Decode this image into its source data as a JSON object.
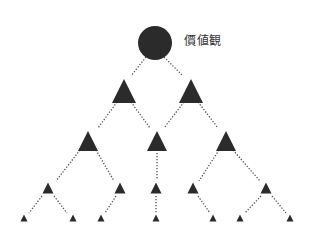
{
  "diagram": {
    "title": "價値観",
    "root": {
      "shape": "circle",
      "cx": 155,
      "cy": 43,
      "r": 17,
      "label": "價値観"
    },
    "colors": {
      "node": "#2b2b2b",
      "edge": "#555555",
      "label": "#333333",
      "background": "#ffffff"
    },
    "levels": [
      {
        "size": 24,
        "y": 91,
        "nodes": [
          124,
          191
        ]
      },
      {
        "size": 20,
        "y": 141,
        "nodes": [
          88,
          157,
          226
        ]
      },
      {
        "size": 11,
        "y": 188,
        "nodes": [
          48,
          120,
          156,
          193,
          266
        ]
      },
      {
        "size": 7,
        "y": 218,
        "nodes": [
          24,
          73,
          101,
          156,
          213,
          240,
          290
        ]
      }
    ],
    "edges": [
      {
        "from": [
          146,
          57
        ],
        "to": [
          131,
          76
        ]
      },
      {
        "from": [
          164,
          57
        ],
        "to": [
          183,
          76
        ]
      },
      {
        "from": [
          117,
          102
        ],
        "to": [
          98,
          128
        ]
      },
      {
        "from": [
          131,
          102
        ],
        "to": [
          150,
          128
        ]
      },
      {
        "from": [
          184,
          102
        ],
        "to": [
          164,
          128
        ]
      },
      {
        "from": [
          198,
          102
        ],
        "to": [
          218,
          128
        ]
      },
      {
        "from": [
          80,
          150
        ],
        "to": [
          56,
          181
        ]
      },
      {
        "from": [
          96,
          150
        ],
        "to": [
          114,
          181
        ]
      },
      {
        "from": [
          157,
          153
        ],
        "to": [
          157,
          180
        ]
      },
      {
        "from": [
          219,
          150
        ],
        "to": [
          199,
          181
        ]
      },
      {
        "from": [
          233,
          150
        ],
        "to": [
          260,
          181
        ]
      },
      {
        "from": [
          42,
          196
        ],
        "to": [
          29,
          213
        ]
      },
      {
        "from": [
          54,
          196
        ],
        "to": [
          67,
          213
        ]
      },
      {
        "from": [
          116,
          196
        ],
        "to": [
          105,
          213
        ]
      },
      {
        "from": [
          156,
          196
        ],
        "to": [
          156,
          213
        ]
      },
      {
        "from": [
          198,
          196
        ],
        "to": [
          210,
          213
        ]
      },
      {
        "from": [
          261,
          196
        ],
        "to": [
          245,
          213
        ]
      },
      {
        "from": [
          272,
          196
        ],
        "to": [
          286,
          213
        ]
      }
    ]
  }
}
